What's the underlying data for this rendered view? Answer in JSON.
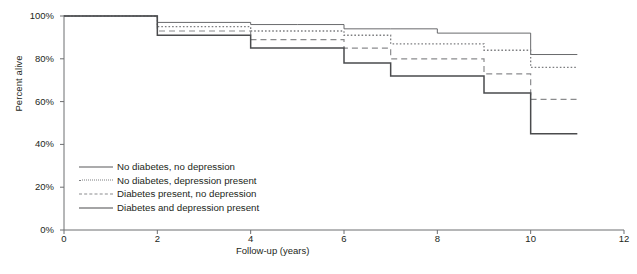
{
  "chart_data": {
    "type": "line",
    "title": "",
    "xlabel": "Follow-up (years)",
    "ylabel": "Percent alive",
    "xlim": [
      0,
      12
    ],
    "ylim": [
      0,
      100
    ],
    "grid": false,
    "step": "post",
    "legend_position": "inside-bottom-left",
    "xticks": [
      0,
      2,
      4,
      6,
      8,
      10,
      12
    ],
    "xtick_labels": [
      "0",
      "2",
      "4",
      "6",
      "8",
      "10",
      "12"
    ],
    "yticks": [
      0,
      20,
      40,
      60,
      80,
      100
    ],
    "ytick_labels": [
      "0%",
      "20%",
      "40%",
      "60%",
      "80%",
      "100%"
    ],
    "x": [
      0,
      1,
      2,
      3,
      4,
      5,
      6,
      7,
      8,
      9,
      10,
      11
    ],
    "series": [
      {
        "name": "No diabetes, no depression",
        "style": "solid-thin",
        "color": "#58595b",
        "values": [
          100,
          100,
          97,
          97,
          96,
          96,
          94,
          94,
          92,
          92,
          82,
          82
        ]
      },
      {
        "name": "No diabetes, depression present",
        "style": "dotted",
        "color": "#7d7e80",
        "values": [
          100,
          100,
          95,
          95,
          93,
          93,
          91,
          87,
          87,
          84,
          76,
          76
        ]
      },
      {
        "name": "Diabetes present, no depression",
        "style": "dashed",
        "color": "#8a8b8d",
        "values": [
          100,
          100,
          93,
          93,
          89,
          89,
          85,
          80,
          80,
          73,
          61,
          61
        ]
      },
      {
        "name": "Diabetes and depression present",
        "style": "solid-thick",
        "color": "#4a4b4d",
        "values": [
          100,
          100,
          91,
          91,
          85,
          85,
          78,
          72,
          72,
          64,
          45,
          45
        ]
      }
    ]
  },
  "legend": {
    "items": [
      {
        "label": "No diabetes, no depression"
      },
      {
        "label": "No diabetes, depression present"
      },
      {
        "label": "Diabetes present, no depression"
      },
      {
        "label": "Diabetes and depression present"
      }
    ]
  }
}
